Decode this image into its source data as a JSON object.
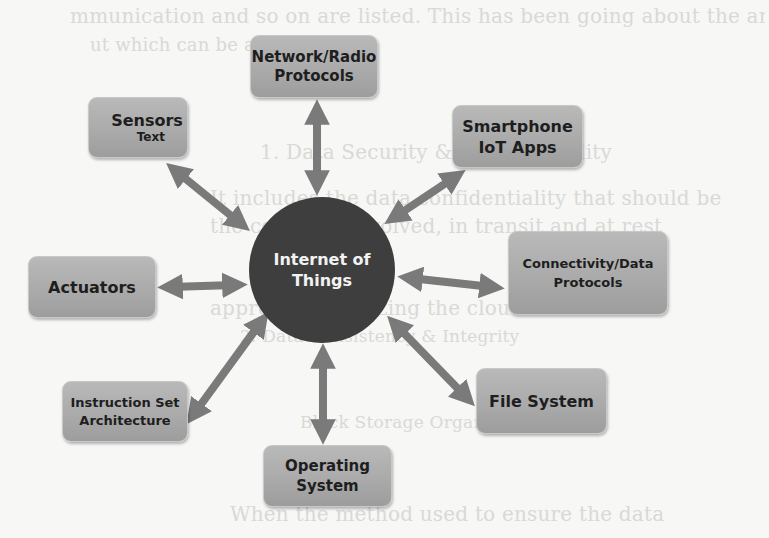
{
  "background_text": {
    "lines": [
      "mmunication and so on are listed. This has been going about the arena",
      "ut which can be applied",
      "1. Data Security & Confidentiality",
      "It includes the data confidentiality that should be",
      "the company involved, in transit and at rest",
      "Protocols used",
      "approaches utilizing the cloud in devices",
      "2. Data Consistency & Integrity",
      "Block Storage Organization",
      "When the method used to ensure the data"
    ]
  },
  "diagram": {
    "hub": {
      "line1": "Internet of",
      "line2": "Things"
    },
    "nodes": {
      "network": {
        "line1": "Network/Radio",
        "line2": "Protocols"
      },
      "sensors": {
        "line1": "Sensors",
        "sub": "Text"
      },
      "smartphone": {
        "line1": "Smartphone",
        "line2": "IoT Apps"
      },
      "connectivity": {
        "line1": "Connectivity/Data",
        "line2": "Protocols"
      },
      "actuators": {
        "line1": "Actuators"
      },
      "isa": {
        "line1": "Instruction Set",
        "line2": "Architecture"
      },
      "filesystem": {
        "line1": "File System"
      },
      "os": {
        "line1": "Operating",
        "line2": "System"
      }
    },
    "colors": {
      "hub": "#3e3e3e",
      "node": "#ababab",
      "arrow": "#7a7a7a",
      "background": "#f7f7f5"
    }
  }
}
